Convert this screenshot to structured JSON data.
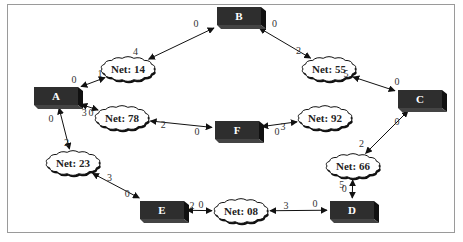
{
  "diagram": {
    "nodes": [
      {
        "id": "A",
        "label": "A"
      },
      {
        "id": "B",
        "label": "B"
      },
      {
        "id": "C",
        "label": "C"
      },
      {
        "id": "D",
        "label": "D"
      },
      {
        "id": "E",
        "label": "E"
      },
      {
        "id": "F",
        "label": "F"
      }
    ],
    "nets": [
      {
        "id": "net14",
        "label": "Net: 14"
      },
      {
        "id": "net55",
        "label": "Net: 55"
      },
      {
        "id": "net78",
        "label": "Net: 78"
      },
      {
        "id": "net92",
        "label": "Net: 92"
      },
      {
        "id": "net23",
        "label": "Net: 23"
      },
      {
        "id": "net66",
        "label": "Net: 66"
      },
      {
        "id": "net08",
        "label": "Net: 08"
      }
    ],
    "edges": [
      {
        "node": "A",
        "net": "net14",
        "node_port": "0",
        "net_port": "1"
      },
      {
        "node": "B",
        "net": "net14",
        "node_port": "0",
        "net_port": "4"
      },
      {
        "node": "B",
        "net": "net55",
        "node_port": "0",
        "net_port": "2"
      },
      {
        "node": "C",
        "net": "net55",
        "node_port": "0",
        "net_port": "5"
      },
      {
        "node": "A",
        "net": "net78",
        "node_port": "0",
        "net_port": "3"
      },
      {
        "node": "F",
        "net": "net78",
        "node_port": "0",
        "net_port": "2"
      },
      {
        "node": "F",
        "net": "net92",
        "node_port": "0",
        "net_port": "3"
      },
      {
        "node": "A",
        "net": "net23",
        "node_port": "0",
        "net_port": "2"
      },
      {
        "node": "E",
        "net": "net23",
        "node_port": "0",
        "net_port": "3"
      },
      {
        "node": "E",
        "net": "net08",
        "node_port": "0",
        "net_port": "2"
      },
      {
        "node": "D",
        "net": "net08",
        "node_port": "0",
        "net_port": "3"
      },
      {
        "node": "C",
        "net": "net66",
        "node_port": "0",
        "net_port": "2"
      },
      {
        "node": "D",
        "net": "net66",
        "node_port": "0",
        "net_port": "5"
      }
    ]
  }
}
